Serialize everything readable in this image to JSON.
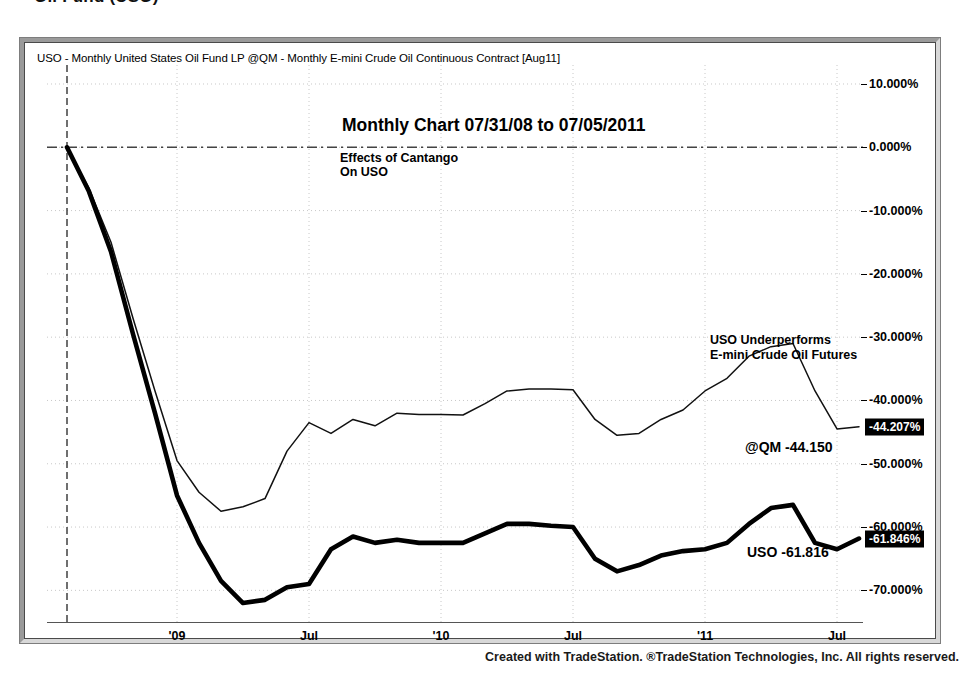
{
  "page": {
    "heading": "Oil Fund (USO)"
  },
  "chart_header": {
    "symbols_line": "USO - Monthly  United States Oil Fund LP  @QM - Monthly  E-mini Crude Oil Continuous Contract [Aug11]"
  },
  "annotations": {
    "title": "Monthly Chart 07/31/08 to 07/05/2011",
    "subtitle_line1": "Effects of Cantango",
    "subtitle_line2": "On USO",
    "callout_line1": "USO Underperforms",
    "callout_line2": "E-mini Crude Oil Futures",
    "label_qm": "@QM -44.150",
    "label_uso": "USO -61.816"
  },
  "axis": {
    "y_ticks": [
      "10.000%",
      "0.000%",
      "-10.000%",
      "-20.000%",
      "-30.000%",
      "-40.000%",
      "-50.000%",
      "-60.000%",
      "-70.000%"
    ],
    "y_values": [
      10,
      0,
      -10,
      -20,
      -30,
      -40,
      -50,
      -60,
      -70
    ],
    "x_ticks": [
      "'09",
      "Jul",
      "'10",
      "Jul",
      "'11",
      "Jul"
    ],
    "value_marker_qm": "-44.207%",
    "value_marker_uso": "-61.846%"
  },
  "footer": {
    "credit": "Created with TradeStation. ®TradeStation Technologies, Inc. All rights reserved."
  },
  "colors": {
    "line_uso": "#000000",
    "line_qm": "#1a1a1a",
    "grid": "#c8c8c8",
    "frame": "#9a9a9a",
    "marker_bg": "#000000",
    "marker_text": "#ffffff"
  },
  "chart_data": {
    "type": "line",
    "title": "Monthly Chart 07/31/08 to 07/05/2011",
    "subtitle": "Effects of Cantango On USO",
    "xlabel": "",
    "ylabel": "Percent change (%)",
    "ylim": [
      -75,
      13
    ],
    "xlim": [
      "2008-07-31",
      "2011-07-05"
    ],
    "grid": true,
    "legend": "in-plot series labels at right",
    "x": [
      "2008-07",
      "2008-08",
      "2008-09",
      "2008-10",
      "2008-11",
      "2008-12",
      "2009-01",
      "2009-02",
      "2009-03",
      "2009-04",
      "2009-05",
      "2009-06",
      "2009-07",
      "2009-08",
      "2009-09",
      "2009-10",
      "2009-11",
      "2009-12",
      "2010-01",
      "2010-02",
      "2010-03",
      "2010-04",
      "2010-05",
      "2010-06",
      "2010-07",
      "2010-08",
      "2010-09",
      "2010-10",
      "2010-11",
      "2010-12",
      "2011-01",
      "2011-02",
      "2011-03",
      "2011-04",
      "2011-05",
      "2011-06",
      "2011-07"
    ],
    "series": [
      {
        "name": "@QM (E-mini Crude Oil Continuous Contract)",
        "final_value": -44.15,
        "marker_value": -44.207,
        "values": [
          0.0,
          -6.5,
          -15.0,
          -27.0,
          -38.5,
          -49.5,
          -54.5,
          -57.5,
          -56.8,
          -55.5,
          -48.0,
          -43.5,
          -45.2,
          -43.0,
          -44.0,
          -42.0,
          -42.2,
          -42.2,
          -42.3,
          -40.5,
          -38.5,
          -38.2,
          -38.2,
          -38.3,
          -43.0,
          -45.5,
          -45.2,
          -43.0,
          -41.5,
          -38.5,
          -36.5,
          -33.0,
          -31.5,
          -31.0,
          -38.5,
          -44.5,
          -44.15
        ]
      },
      {
        "name": "USO (United States Oil Fund LP)",
        "final_value": -61.816,
        "marker_value": -61.846,
        "values": [
          0.0,
          -7.0,
          -16.5,
          -29.5,
          -42.0,
          -55.0,
          -62.5,
          -68.5,
          -72.0,
          -71.5,
          -69.5,
          -69.0,
          -63.5,
          -61.5,
          -62.5,
          -62.0,
          -62.5,
          -62.5,
          -62.5,
          -61.0,
          -59.5,
          -59.5,
          -59.8,
          -60.0,
          -65.0,
          -67.0,
          -66.0,
          -64.5,
          -63.8,
          -63.5,
          -62.5,
          -59.5,
          -57.0,
          -56.5,
          -62.5,
          -63.5,
          -61.816
        ]
      }
    ]
  }
}
